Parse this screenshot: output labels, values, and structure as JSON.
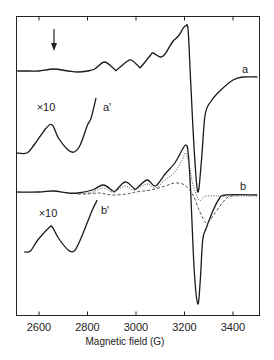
{
  "chart_data": {
    "type": "line",
    "title": "",
    "xlabel": "Magnetic field (G)",
    "ylabel": "",
    "xlim": [
      2505,
      3500
    ],
    "xticks": [
      2600,
      2800,
      3000,
      3200,
      3400
    ],
    "xtick_labels": [
      "2600",
      "2800",
      "3000",
      "3200",
      "3400"
    ],
    "grid": false,
    "legend": "inline labels",
    "y_units": "arbitrary (derivative EPR signal, vertically offset traces)",
    "annotations": [
      {
        "text": "arrow",
        "field": 2660,
        "description": "downward arrow above trace a"
      },
      {
        "text": "×10",
        "near": "a'"
      },
      {
        "text": "×10",
        "near": "b'"
      }
    ],
    "series": [
      {
        "name": "a",
        "label": "a",
        "style": "solid",
        "points": [
          [
            2510,
            71
          ],
          [
            2560,
            71
          ],
          [
            2600,
            71
          ],
          [
            2660,
            69
          ],
          [
            2720,
            71
          ],
          [
            2760,
            72
          ],
          [
            2800,
            71
          ],
          [
            2830,
            69
          ],
          [
            2870,
            62
          ],
          [
            2910,
            69
          ],
          [
            2920,
            70
          ],
          [
            2960,
            62
          ],
          [
            2980,
            60
          ],
          [
            3010,
            66
          ],
          [
            3020,
            67
          ],
          [
            3060,
            55
          ],
          [
            3070,
            53
          ],
          [
            3100,
            57
          ],
          [
            3120,
            54
          ],
          [
            3150,
            42
          ],
          [
            3175,
            36
          ],
          [
            3195,
            28
          ],
          [
            3205,
            26
          ],
          [
            3215,
            30
          ],
          [
            3225,
            80
          ],
          [
            3240,
            150
          ],
          [
            3255,
            192
          ],
          [
            3270,
            160
          ],
          [
            3285,
            115
          ],
          [
            3310,
            101
          ],
          [
            3350,
            90
          ],
          [
            3400,
            80
          ],
          [
            3440,
            77
          ],
          [
            3500,
            77
          ]
        ]
      },
      {
        "name": "a'",
        "label": "a'",
        "style": "solid",
        "scale": "×10",
        "points": [
          [
            2505,
            153
          ],
          [
            2550,
            153
          ],
          [
            2580,
            145
          ],
          [
            2630,
            128
          ],
          [
            2655,
            125
          ],
          [
            2680,
            138
          ],
          [
            2720,
            150
          ],
          [
            2745,
            152
          ],
          [
            2770,
            145
          ],
          [
            2800,
            125
          ],
          [
            2815,
            118
          ],
          [
            2835,
            98
          ]
        ]
      },
      {
        "name": "b",
        "label": "b",
        "style": "solid",
        "points": [
          [
            2510,
            192
          ],
          [
            2600,
            192
          ],
          [
            2660,
            191
          ],
          [
            2720,
            193
          ],
          [
            2760,
            193
          ],
          [
            2820,
            190
          ],
          [
            2865,
            185
          ],
          [
            2905,
            191
          ],
          [
            2915,
            191
          ],
          [
            2955,
            182
          ],
          [
            2990,
            188
          ],
          [
            3000,
            189
          ],
          [
            3045,
            180
          ],
          [
            3080,
            186
          ],
          [
            3120,
            174
          ],
          [
            3160,
            163
          ],
          [
            3190,
            150
          ],
          [
            3205,
            145
          ],
          [
            3215,
            152
          ],
          [
            3225,
            190
          ],
          [
            3240,
            270
          ],
          [
            3255,
            304
          ],
          [
            3265,
            280
          ],
          [
            3275,
            240
          ],
          [
            3290,
            228
          ],
          [
            3310,
            215
          ],
          [
            3340,
            200
          ],
          [
            3370,
            195
          ],
          [
            3500,
            195
          ]
        ]
      },
      {
        "name": "b (simulated, dotted)",
        "label": "",
        "style": "dotted",
        "points": [
          [
            2760,
            194
          ],
          [
            2820,
            192
          ],
          [
            2865,
            188
          ],
          [
            2905,
            192
          ],
          [
            2955,
            186
          ],
          [
            2990,
            190
          ],
          [
            3045,
            184
          ],
          [
            3080,
            188
          ],
          [
            3120,
            180
          ],
          [
            3160,
            172
          ],
          [
            3190,
            160
          ],
          [
            3205,
            153
          ],
          [
            3220,
            165
          ],
          [
            3235,
            185
          ],
          [
            3260,
            200
          ],
          [
            3275,
            198
          ],
          [
            3290,
            196
          ],
          [
            3350,
            196
          ],
          [
            3500,
            196
          ]
        ]
      },
      {
        "name": "b (broad component, dashed)",
        "label": "",
        "style": "dashed",
        "points": [
          [
            2760,
            194
          ],
          [
            2800,
            194
          ],
          [
            2850,
            193
          ],
          [
            2900,
            195
          ],
          [
            2960,
            194
          ],
          [
            3000,
            192
          ],
          [
            3060,
            190
          ],
          [
            3120,
            186
          ],
          [
            3160,
            183
          ],
          [
            3200,
            185
          ],
          [
            3235,
            195
          ],
          [
            3260,
            210
          ],
          [
            3285,
            222
          ],
          [
            3300,
            222
          ],
          [
            3320,
            215
          ],
          [
            3350,
            205
          ],
          [
            3380,
            197
          ],
          [
            3420,
            195
          ]
        ]
      },
      {
        "name": "b'",
        "label": "b'",
        "style": "solid",
        "scale": "×10",
        "points": [
          [
            2540,
            252
          ],
          [
            2565,
            251
          ],
          [
            2595,
            240
          ],
          [
            2640,
            228
          ],
          [
            2655,
            227
          ],
          [
            2680,
            238
          ],
          [
            2720,
            250
          ],
          [
            2745,
            251
          ],
          [
            2770,
            240
          ],
          [
            2800,
            222
          ],
          [
            2820,
            210
          ],
          [
            2840,
            200
          ]
        ]
      }
    ]
  },
  "labels": {
    "xlabel": "Magnetic field (G)",
    "a": "a",
    "a_prime": "a'",
    "b": "b",
    "b_prime": "b'",
    "scale_a": "×10",
    "scale_b": "×10"
  },
  "ticks": [
    "2600",
    "2800",
    "3000",
    "3200",
    "3400"
  ]
}
